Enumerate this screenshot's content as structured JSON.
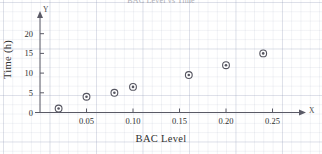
{
  "figure": {
    "title": "BAC Level vs Time",
    "axis_letter_x": "X",
    "axis_letter_y": "Y"
  },
  "chart_data": {
    "type": "scatter",
    "title": "BAC Level vs Time",
    "xlabel": "BAC Level",
    "ylabel": "Time (h)",
    "xlim": [
      0.0,
      0.285
    ],
    "ylim": [
      0,
      23
    ],
    "xticks": [
      0.05,
      0.1,
      0.15,
      0.2,
      0.25
    ],
    "xticklabels": [
      "0.05",
      "0.10",
      "0.15",
      "0.20",
      "0.25"
    ],
    "yticks": [
      0,
      5,
      10,
      15,
      20
    ],
    "yticklabels": [
      "0",
      "5",
      "10",
      "15",
      "20"
    ],
    "grid": true,
    "legend": "none",
    "marker": "circle-with-center-dot",
    "marker_color": "#555560",
    "points": [
      {
        "x": 0.02,
        "y": 1.0
      },
      {
        "x": 0.05,
        "y": 4.0
      },
      {
        "x": 0.08,
        "y": 5.0
      },
      {
        "x": 0.1,
        "y": 6.5
      },
      {
        "x": 0.16,
        "y": 9.5
      },
      {
        "x": 0.2,
        "y": 12.0
      },
      {
        "x": 0.24,
        "y": 15.0
      }
    ]
  }
}
